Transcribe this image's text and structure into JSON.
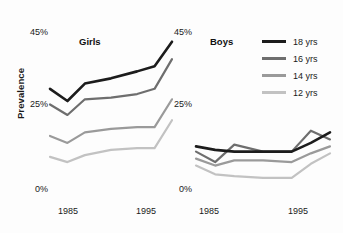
{
  "chart_data": {
    "type": "line",
    "title": "",
    "xlabel": "",
    "ylabel": "Prevalence",
    "ylim": [
      0,
      45
    ],
    "yticks": [
      0,
      25,
      45
    ],
    "ytick_labels": [
      "0%",
      "25%",
      "45%"
    ],
    "grid": false,
    "legend_position": "right",
    "panels": [
      {
        "name": "girls-panel",
        "title": "Girls",
        "x": [
          1983,
          1985,
          1987,
          1990,
          1993,
          1995,
          1997
        ],
        "xtick_values": [
          1985,
          1995
        ],
        "xtick_labels": [
          "1985",
          "1995"
        ],
        "series": [
          {
            "name": "18 yrs",
            "values": [
              29.0,
              25.5,
              30.5,
              32.0,
              34.0,
              35.5,
              42.5
            ],
            "color": "#1c1c1c"
          },
          {
            "name": "16 yrs",
            "values": [
              24.5,
              21.5,
              26.0,
              26.5,
              27.5,
              29.0,
              37.5
            ],
            "color": "#6e6e6e"
          },
          {
            "name": "14 yrs",
            "values": [
              15.5,
              13.5,
              16.5,
              17.5,
              18.0,
              18.0,
              26.0
            ],
            "color": "#9a9a9a"
          },
          {
            "name": "12 yrs",
            "values": [
              9.5,
              8.0,
              10.0,
              11.5,
              12.0,
              12.0,
              20.0
            ],
            "color": "#c2c2c2"
          }
        ]
      },
      {
        "name": "boys-panel",
        "title": "Boys",
        "x": [
          1983,
          1985,
          1987,
          1990,
          1993,
          1995,
          1997
        ],
        "xtick_values": [
          1985,
          1995
        ],
        "xtick_labels": [
          "1985",
          "1995"
        ],
        "series": [
          {
            "name": "18 yrs",
            "values": [
              12.5,
              11.5,
              11.0,
              11.0,
              11.0,
              13.5,
              16.5
            ],
            "color": "#1c1c1c"
          },
          {
            "name": "16 yrs",
            "values": [
              11.0,
              8.0,
              13.0,
              11.0,
              11.0,
              17.0,
              14.5
            ],
            "color": "#6e6e6e"
          },
          {
            "name": "14 yrs",
            "values": [
              9.0,
              7.0,
              8.5,
              8.5,
              8.0,
              10.5,
              12.5
            ],
            "color": "#9a9a9a"
          },
          {
            "name": "12 yrs",
            "values": [
              7.0,
              4.5,
              4.0,
              3.5,
              3.5,
              7.5,
              10.5
            ],
            "color": "#c2c2c2"
          }
        ]
      }
    ],
    "legend": [
      {
        "label": "18 yrs",
        "color": "#1c1c1c"
      },
      {
        "label": "16 yrs",
        "color": "#6e6e6e"
      },
      {
        "label": "14 yrs",
        "color": "#9a9a9a"
      },
      {
        "label": "12 yrs",
        "color": "#c2c2c2"
      }
    ]
  }
}
